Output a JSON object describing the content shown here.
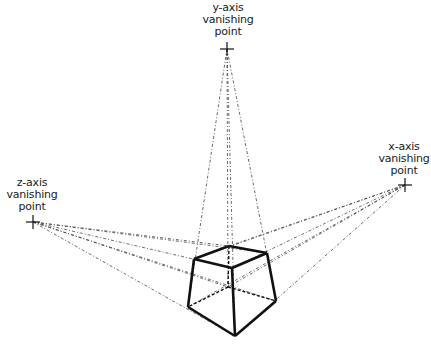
{
  "diagram": {
    "labels": {
      "y": [
        "y-axis",
        "vanishing",
        "point"
      ],
      "x": [
        "x-axis",
        "vanishing",
        "point"
      ],
      "z": [
        "z-axis",
        "vanishing",
        "point"
      ]
    },
    "vanishing_points": {
      "y": [
        227,
        49
      ],
      "x": [
        405,
        185
      ],
      "z": [
        33,
        222
      ]
    },
    "cube_vertices": {
      "top_left": [
        194,
        259
      ],
      "top_back": [
        229,
        246
      ],
      "top_right": [
        267,
        253
      ],
      "top_front": [
        232,
        268
      ],
      "bottom_left": [
        188,
        307
      ],
      "bottom_back": [
        228,
        287
      ],
      "bottom_right": [
        276,
        301
      ],
      "bottom_front": [
        235,
        336
      ]
    },
    "colors": {
      "line": "#111111",
      "construction": "#444444"
    }
  }
}
